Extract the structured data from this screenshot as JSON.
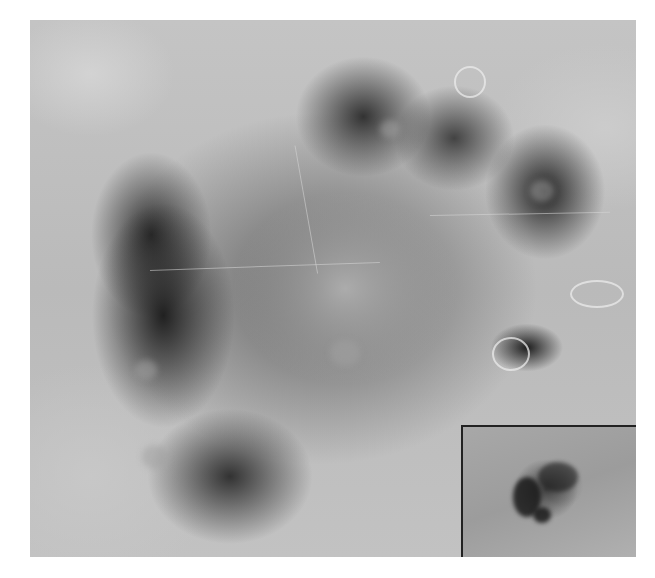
{
  "figure": {
    "type": "dermoscopy-photograph",
    "colors": {
      "background": "#ffffff",
      "skin": "#bdbdbd",
      "pigment_dark": "#191919",
      "regression_light": "#afafaf",
      "inset_border": "#222222"
    },
    "inset": {
      "position": "bottom-right",
      "description": "Clinical overview photo of the lesion"
    }
  }
}
